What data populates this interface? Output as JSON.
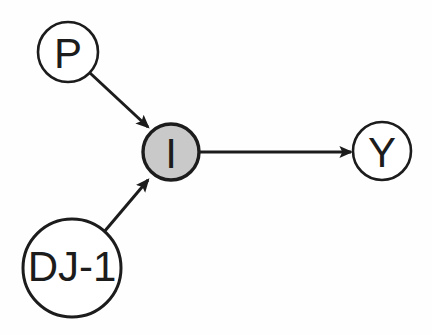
{
  "diagram": {
    "background_color": "#fefefe",
    "stroke_color": "#1c1c1c",
    "text_color": "#1c1c1c",
    "nodes": [
      {
        "id": "p",
        "label": "P",
        "shape": "circle",
        "cx": 68,
        "cy": 52,
        "r": 30,
        "fill": "#ffffff",
        "stroke": "#1c1c1c",
        "stroke_width": 2.6,
        "font_size": 42
      },
      {
        "id": "i",
        "label": "I",
        "shape": "circle",
        "cx": 171,
        "cy": 152,
        "r": 28,
        "fill": "#c9c9c9",
        "stroke": "#1c1c1c",
        "stroke_width": 3.4,
        "font_size": 42
      },
      {
        "id": "dj1",
        "label": "DJ-1",
        "shape": "circle",
        "cx": 72,
        "cy": 268,
        "r": 49,
        "fill": "#ffffff",
        "stroke": "#1c1c1c",
        "stroke_width": 3.0,
        "font_size": 42
      },
      {
        "id": "y",
        "label": "Y",
        "shape": "circle",
        "cx": 382,
        "cy": 151,
        "r": 29,
        "fill": "#ffffff",
        "stroke": "#1c1c1c",
        "stroke_width": 2.6,
        "font_size": 42
      }
    ],
    "edges": [
      {
        "id": "p-to-i",
        "from": "p",
        "to": "i",
        "x1": 90,
        "y1": 73,
        "x2": 148,
        "y2": 127,
        "stroke": "#1c1c1c",
        "stroke_width": 3.0,
        "arrowhead": "filled-triangle"
      },
      {
        "id": "dj1-to-i",
        "from": "dj1",
        "to": "i",
        "x1": 104,
        "y1": 232,
        "x2": 148,
        "y2": 180,
        "stroke": "#1c1c1c",
        "stroke_width": 3.0,
        "arrowhead": "filled-triangle"
      },
      {
        "id": "i-to-y",
        "from": "i",
        "to": "y",
        "x1": 200,
        "y1": 152,
        "x2": 351,
        "y2": 152,
        "stroke": "#1c1c1c",
        "stroke_width": 3.0,
        "arrowhead": "filled-triangle"
      }
    ]
  }
}
